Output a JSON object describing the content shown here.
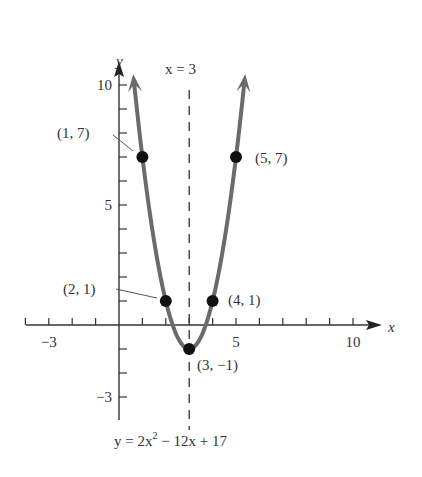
{
  "chart_data": {
    "type": "line",
    "title": "",
    "equation": "y = 2x² − 12x + 17",
    "equation_parts": {
      "pre": "y = 2x",
      "sup": "2",
      "post": " − 12x + 17"
    },
    "xlabel": "x",
    "ylabel": "y",
    "xlim": [
      -4,
      11
    ],
    "ylim": [
      -4,
      11
    ],
    "x_tick_labels": [
      "−3",
      "5",
      "10"
    ],
    "x_tick_label_values": [
      -3,
      5,
      10
    ],
    "y_tick_labels": [
      "10",
      "5",
      "−3"
    ],
    "y_tick_label_values": [
      10,
      5,
      -3
    ],
    "grid": false,
    "axis_of_symmetry": {
      "label": "x = 3",
      "x": 3
    },
    "series": [
      {
        "name": "y = 2x² − 12x + 17",
        "color": "#6b6b6b",
        "x_range": [
          0.65,
          5.35
        ]
      }
    ],
    "points": [
      {
        "x": 1,
        "y": 7,
        "label": "(1, 7)"
      },
      {
        "x": 5,
        "y": 7,
        "label": "(5, 7)"
      },
      {
        "x": 2,
        "y": 1,
        "label": "(2, 1)"
      },
      {
        "x": 4,
        "y": 1,
        "label": "(4, 1)"
      },
      {
        "x": 3,
        "y": -1,
        "label": "(3, −1)"
      }
    ]
  }
}
